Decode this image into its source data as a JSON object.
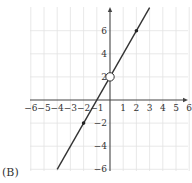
{
  "option_label": "(B)",
  "chart_data": {
    "type": "line",
    "title": "",
    "xlabel": "",
    "ylabel": "",
    "xlim": [
      -6,
      6
    ],
    "ylim": [
      -6,
      7.9
    ],
    "grid": true,
    "x_ticks": [
      -6,
      -5,
      -4,
      -3,
      -2,
      -1,
      1,
      2,
      3,
      4,
      5,
      6
    ],
    "y_ticks": [
      -6,
      -4,
      -2,
      2,
      4,
      6
    ],
    "x_tick_labels": [
      "−6",
      "−5",
      "−4",
      "−3",
      "−2",
      "−1",
      "1",
      "2",
      "3",
      "4",
      "5",
      "6"
    ],
    "y_tick_labels": [
      "−6",
      "−4",
      "−2",
      "2",
      "4",
      "6"
    ],
    "series": [
      {
        "name": "line",
        "x": [
          -4,
          3
        ],
        "y": [
          -6,
          8
        ],
        "color": "#333333"
      }
    ],
    "points": [
      {
        "x": 2,
        "y": 6,
        "style": "filled"
      },
      {
        "x": -2,
        "y": -2,
        "style": "filled"
      },
      {
        "x": 0,
        "y": 2,
        "style": "open"
      }
    ]
  }
}
